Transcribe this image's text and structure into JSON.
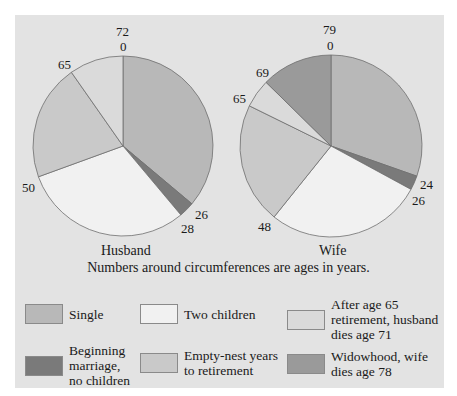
{
  "chart_data": [
    {
      "type": "pie",
      "title": "Husband",
      "unit": "ages in years",
      "total_age": 72,
      "boundaries": [
        0,
        26,
        28,
        50,
        65,
        72
      ],
      "categories": [
        "Single",
        "Beginning marriage, no children",
        "Two children",
        "Empty-nest years to retirement",
        "After age 65 retirement, husband dies age 71"
      ],
      "values": [
        26,
        2,
        22,
        15,
        7
      ],
      "circumference_labels": [
        "72",
        "0",
        "26",
        "28",
        "50",
        "65"
      ]
    },
    {
      "type": "pie",
      "title": "Wife",
      "unit": "ages in years",
      "total_age": 79,
      "boundaries": [
        0,
        24,
        26,
        48,
        65,
        69,
        79
      ],
      "categories": [
        "Single",
        "Beginning marriage, no children",
        "Two children",
        "Empty-nest years to retirement",
        "After age 65 retirement, husband dies age 71",
        "Widowhood, wife dies age 78"
      ],
      "values": [
        24,
        2,
        22,
        17,
        4,
        10
      ],
      "circumference_labels": [
        "79",
        "0",
        "24",
        "26",
        "48",
        "65",
        "69"
      ]
    }
  ],
  "pies": {
    "husband": {
      "title": "Husband",
      "top_label": "72",
      "zero_label": "0",
      "labels": [
        "26",
        "28",
        "50",
        "65"
      ]
    },
    "wife": {
      "title": "Wife",
      "top_label": "79",
      "zero_label": "0",
      "labels": [
        "24",
        "26",
        "48",
        "65",
        "69"
      ]
    }
  },
  "note": "Numbers around circumferences are ages in years.",
  "legend": [
    {
      "label": "Single",
      "color": "#b8b8b8"
    },
    {
      "label": "Two children",
      "color": "#f1f1f1"
    },
    {
      "label": "After age 65 retirement, husband dies age 71",
      "color": "#dadada"
    },
    {
      "label": "Beginning marriage, no children",
      "color": "#7a7a7a"
    },
    {
      "label": "Empty-nest years to retirement",
      "color": "#c9c9c9"
    },
    {
      "label": "Widowhood, wife dies age 78",
      "color": "#9a9a9a"
    }
  ],
  "colors": {
    "panel": "#e3e3e3",
    "single": "#b8b8b8",
    "beginning": "#7a7a7a",
    "two_children": "#f1f1f1",
    "empty_nest": "#c9c9c9",
    "after65": "#dadada",
    "widowhood": "#9a9a9a",
    "outline": "#6e6e6e"
  }
}
